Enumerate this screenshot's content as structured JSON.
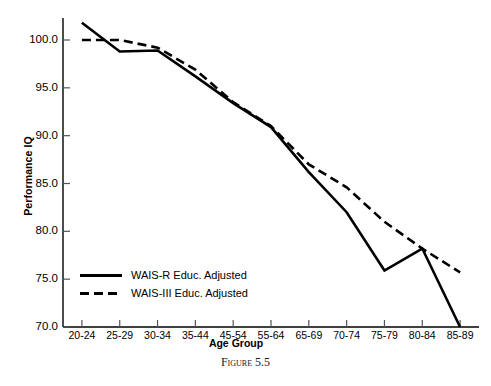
{
  "chart_data": {
    "type": "line",
    "title": "",
    "xlabel": "Age Group",
    "ylabel": "Performance IQ",
    "ylim": [
      70.0,
      102.5
    ],
    "yticks": [
      "70.0",
      "75.0",
      "80.0",
      "85.0",
      "90.0",
      "95.0",
      "100.0"
    ],
    "ytick_values": [
      70.0,
      75.0,
      80.0,
      85.0,
      90.0,
      95.0,
      100.0
    ],
    "grid": false,
    "legend_position": "lower-left-inside",
    "categories": [
      "20-24",
      "25-29",
      "30-34",
      "35-44",
      "45-54",
      "55-64",
      "65-69",
      "70-74",
      "75-79",
      "80-84",
      "85-89"
    ],
    "series": [
      {
        "name": "WAIS-R Educ. Adjusted",
        "style": "solid",
        "color": "#000000",
        "values": [
          101.8,
          98.8,
          98.9,
          96.2,
          93.4,
          90.9,
          86.2,
          82.0,
          75.9,
          78.2,
          70.0
        ]
      },
      {
        "name": "WAIS-III Educ. Adjusted",
        "style": "dashed",
        "color": "#000000",
        "values": [
          100.0,
          100.0,
          99.2,
          96.9,
          93.5,
          91.0,
          87.0,
          84.6,
          81.0,
          78.2,
          75.7
        ]
      }
    ]
  },
  "legend": {
    "items": [
      {
        "label": "WAIS-R Educ. Adjusted",
        "style": "solid"
      },
      {
        "label": "WAIS-III Educ. Adjusted",
        "style": "dashed"
      }
    ]
  },
  "caption": {
    "text": "Figure 5.5"
  },
  "axes": {
    "x_title": "Age Group",
    "y_title": "Performance IQ"
  }
}
